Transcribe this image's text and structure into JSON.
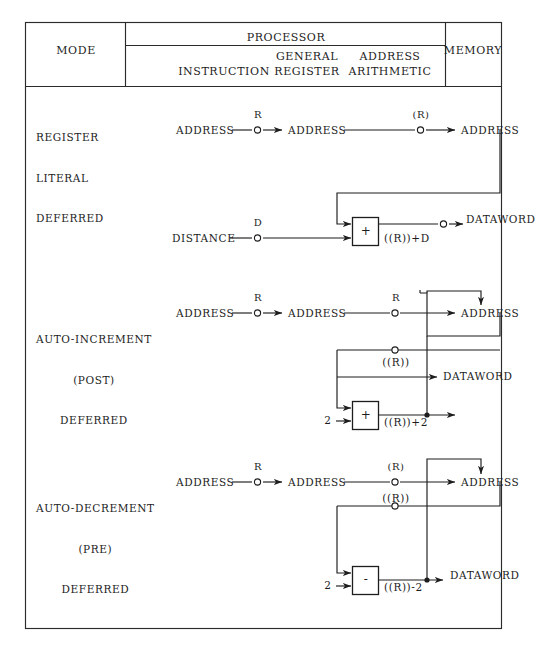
{
  "figure": {
    "kind": "addressing-mode-dataflow-table",
    "columns": {
      "mode": "MODE",
      "processor": "PROCESSOR",
      "processor_sub": {
        "instruction": "INSTRUCTION",
        "general_register_line1": "GENERAL",
        "general_register_line2": "REGISTER",
        "address_arithmetic_line1": "ADDRESS",
        "address_arithmetic_line2": "ARITHMETIC"
      },
      "memory": "MEMORY"
    },
    "rows": [
      {
        "id": "register-literal-deferred",
        "mode_lines": [
          "REGISTER",
          "LITERAL",
          "DEFERRED"
        ],
        "instruction_label": "ADDRESS",
        "node1_label": "R",
        "register_label": "ADDRESS",
        "node2_label": "(R)",
        "memory_label": "ADDRESS",
        "distance_label": "DISTANCE",
        "distance_node_label": "D",
        "operator": "+",
        "result_label": "((R))+D",
        "output_label": "DATAWORD"
      },
      {
        "id": "auto-increment-post-deferred",
        "mode_lines": [
          "AUTO-INCREMENT",
          "(POST)",
          "DEFERRED"
        ],
        "instruction_label": "ADDRESS",
        "node1_label": "R",
        "register_label": "ADDRESS",
        "node2_label": "R",
        "memory_label": "ADDRESS",
        "deref_label": "((R))",
        "operand_label": "2",
        "operator": "+",
        "result_label": "((R))+2",
        "output_label": "DATAWORD"
      },
      {
        "id": "auto-decrement-pre-deferred",
        "mode_lines": [
          "AUTO-DECREMENT",
          "(PRE)",
          "DEFERRED"
        ],
        "instruction_label": "ADDRESS",
        "node1_label": "R",
        "register_label": "ADDRESS",
        "node2_label": "(R)",
        "memory_label": "ADDRESS",
        "deref_label": "((R))",
        "operand_label": "2",
        "operator": "-",
        "result_label": "((R))-2",
        "output_label": "DATAWORD"
      }
    ],
    "style": {
      "ink": "#1d1d1d",
      "paper": "#ffffff",
      "rule": "#2b2b2b"
    }
  }
}
